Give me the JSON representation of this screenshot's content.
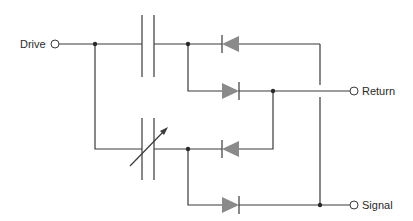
{
  "diagram": {
    "type": "circuit-schematic",
    "terminals": {
      "drive": {
        "label": "Drive"
      },
      "return": {
        "label": "Return"
      },
      "signal": {
        "label": "Signal"
      }
    },
    "components": [
      {
        "id": "C1",
        "kind": "capacitor",
        "variant": "fixed"
      },
      {
        "id": "C2",
        "kind": "capacitor",
        "variant": "variable"
      },
      {
        "id": "D1",
        "kind": "diode",
        "direction": "left"
      },
      {
        "id": "D2",
        "kind": "diode",
        "direction": "right"
      },
      {
        "id": "D3",
        "kind": "diode",
        "direction": "left"
      },
      {
        "id": "D4",
        "kind": "diode",
        "direction": "right"
      }
    ],
    "colors": {
      "wire": "#3a3a3a",
      "diode_fill": "#8a8a8a",
      "background": "#ffffff"
    }
  }
}
